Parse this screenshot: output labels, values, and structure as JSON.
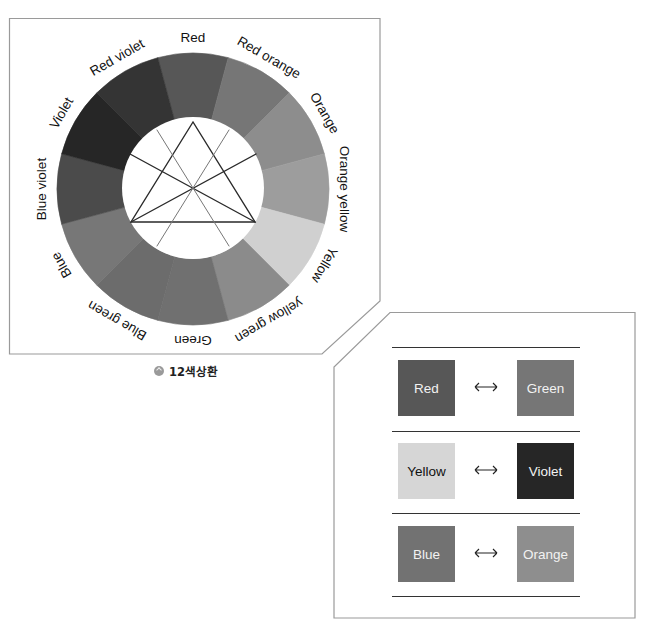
{
  "color_wheel": {
    "title": "12-hue color wheel",
    "segments": [
      {
        "label": "Red",
        "color": "#575757"
      },
      {
        "label": "Red orange",
        "color": "#767676"
      },
      {
        "label": "Orange",
        "color": "#8d8d8d"
      },
      {
        "label": "Orange yellow",
        "color": "#9d9d9d"
      },
      {
        "label": "Yellow",
        "color": "#d0d0d0"
      },
      {
        "label": "yellow green",
        "color": "#8b8b8b"
      },
      {
        "label": "Green",
        "color": "#707070"
      },
      {
        "label": "Blue green",
        "color": "#6c6c6c"
      },
      {
        "label": "Blue",
        "color": "#777777"
      },
      {
        "label": "Blue violet",
        "color": "#4b4b4b"
      },
      {
        "label": "Violet",
        "color": "#262626"
      },
      {
        "label": "Red violet",
        "color": "#343434"
      }
    ],
    "inner_figure": "equilateral triangle with medians"
  },
  "caption": {
    "icon": "circle-badge-icon",
    "text": "12색상환"
  },
  "complementary_pairs": {
    "arrow_icon": "double-arrow-icon",
    "arrow_glyph": "⟷",
    "pairs": [
      {
        "left": {
          "label": "Red",
          "color": "#575757",
          "text_color": "#f2f2f2"
        },
        "right": {
          "label": "Green",
          "color": "#767676",
          "text_color": "#f2f2f2"
        }
      },
      {
        "left": {
          "label": "Yellow",
          "color": "#d6d6d6",
          "text_color": "#111111"
        },
        "right": {
          "label": "Violet",
          "color": "#262626",
          "text_color": "#f2f2f2"
        }
      },
      {
        "left": {
          "label": "Blue",
          "color": "#727272",
          "text_color": "#f2f2f2"
        },
        "right": {
          "label": "Orange",
          "color": "#8e8e8e",
          "text_color": "#f2f2f2"
        }
      }
    ]
  }
}
